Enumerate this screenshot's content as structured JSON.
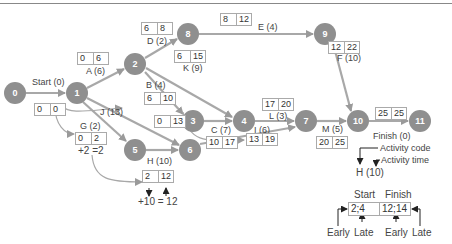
{
  "diagram": {
    "type": "activity-on-arrow network (PERT/CPM)",
    "nodes": [
      {
        "id": "0",
        "x": 15,
        "y": 93
      },
      {
        "id": "1",
        "x": 77,
        "y": 93
      },
      {
        "id": "2",
        "x": 135,
        "y": 64
      },
      {
        "id": "8",
        "x": 188,
        "y": 34
      },
      {
        "id": "9",
        "x": 325,
        "y": 34
      },
      {
        "id": "3",
        "x": 193,
        "y": 121
      },
      {
        "id": "4",
        "x": 244,
        "y": 121
      },
      {
        "id": "7",
        "x": 306,
        "y": 121
      },
      {
        "id": "10",
        "x": 358,
        "y": 121
      },
      {
        "id": "11",
        "x": 420,
        "y": 121
      },
      {
        "id": "5",
        "x": 135,
        "y": 150
      },
      {
        "id": "6",
        "x": 190,
        "y": 150
      }
    ],
    "activities": [
      {
        "label": "Start (0)",
        "from": "0",
        "to": "1",
        "es": "0",
        "ef": "0"
      },
      {
        "label": "A (6)",
        "from": "1",
        "to": "2",
        "es": "0",
        "ef": "6"
      },
      {
        "label": "D (2)",
        "from": "2",
        "to": "8",
        "es": "6",
        "ef": "8"
      },
      {
        "label": "E (4)",
        "from": "8",
        "to": "9",
        "es": "8",
        "ef": "12"
      },
      {
        "label": "F (10)",
        "from": "9",
        "to": "10",
        "es": "12",
        "ef": "22"
      },
      {
        "label": "K (9)",
        "from": "2",
        "to": "4",
        "es": "6",
        "ef": "15"
      },
      {
        "label": "B (4)",
        "from": "2",
        "to": "3",
        "es": "6",
        "ef": "10"
      },
      {
        "label": "C (7)",
        "from": "3",
        "to": "4",
        "es": "10",
        "ef": "17"
      },
      {
        "label": "L (3)",
        "from": "4",
        "to": "7",
        "es": "17",
        "ef": "20"
      },
      {
        "label": "M (5)",
        "from": "7",
        "to": "10",
        "es": "20",
        "ef": "25"
      },
      {
        "label": "Finish (0)",
        "from": "10",
        "to": "11",
        "es": "25",
        "ef": "25"
      },
      {
        "label": "J (13)",
        "from": "1",
        "to": "6",
        "es": "0",
        "ef": "13"
      },
      {
        "label": "I (6)",
        "from": "6",
        "to": "7",
        "es": "13",
        "ef": "19"
      },
      {
        "label": "G (2)",
        "from": "1",
        "to": "5",
        "es": "0",
        "ef": "2"
      },
      {
        "label": "H (10)",
        "from": "5",
        "to": "6",
        "es": "2",
        "ef": "12"
      }
    ],
    "annotations": {
      "g_calc": "+2 =2",
      "h_calc": "+10 = 12"
    },
    "legend": {
      "activity_code_label": "Activity code",
      "activity_time_label": "Activity time",
      "example_activity": "H (10)",
      "start_header": "Start",
      "finish_header": "Finish",
      "start_value": "2;4",
      "finish_value": "12;14",
      "early_label_1": "Early",
      "late_label_1": "Late",
      "early_label_2": "Early",
      "late_label_2": "Late"
    }
  }
}
